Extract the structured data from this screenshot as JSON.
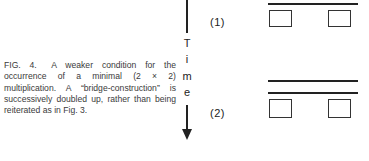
{
  "caption": {
    "figure_label": "FIG. 4.",
    "text": "A weaker condition for the occurrence of a minimal (2 × 2) multiplication. A “bridge-construction” is successively doubled up, rather than being reiterated as in Fig. 3."
  },
  "diagram": {
    "axis_label_letters": [
      "T",
      "i",
      "m",
      "e"
    ],
    "axis_direction": "down-arrow",
    "stages": [
      {
        "label": "(1)",
        "lines": 1,
        "boxes": 2
      },
      {
        "label": "(2)",
        "lines": 2,
        "boxes": 2
      }
    ]
  }
}
